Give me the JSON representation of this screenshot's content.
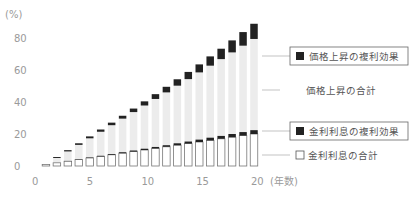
{
  "chart_data": {
    "type": "bar",
    "title": "",
    "xlabel": "(年数)",
    "ylabel": "(%)",
    "ylim": [
      0,
      80
    ],
    "xlim": [
      0,
      20
    ],
    "yticks": [
      "0",
      "20",
      "40",
      "60",
      "80"
    ],
    "xticks": [
      "0",
      "5",
      "10",
      "15",
      "20"
    ],
    "grid": false,
    "categories": [
      1,
      2,
      3,
      4,
      5,
      6,
      7,
      8,
      9,
      10,
      11,
      12,
      13,
      14,
      15,
      16,
      17,
      18,
      19,
      20
    ],
    "series": [
      {
        "name": "金利利息の合計",
        "values": [
          1,
          2,
          3,
          4,
          5,
          6,
          7,
          8,
          9,
          10,
          11,
          12,
          13,
          14,
          15,
          16,
          17,
          18,
          19,
          20
        ]
      },
      {
        "name": "金利利息の複利効果",
        "values": [
          0,
          0,
          0.1,
          0.2,
          0.3,
          0.4,
          0.5,
          0.6,
          0.7,
          0.8,
          0.9,
          1.0,
          1.2,
          1.3,
          1.5,
          1.7,
          1.8,
          2.0,
          2.2,
          2.4
        ]
      },
      {
        "name": "価格上昇の合計",
        "values": [
          0,
          3,
          6,
          9,
          12,
          15,
          18,
          21,
          24,
          27,
          30,
          33,
          36,
          39,
          42,
          45,
          48,
          51,
          54,
          57
        ]
      },
      {
        "name": "価格上昇の複利効果",
        "values": [
          0,
          0.6,
          0.8,
          1.0,
          1.2,
          1.4,
          1.6,
          1.8,
          2.2,
          2.6,
          3.0,
          3.5,
          4.0,
          4.5,
          5.0,
          5.8,
          6.5,
          7.5,
          8.5,
          9.5
        ]
      }
    ],
    "legend": [
      {
        "label": "価格上昇の複利効果",
        "marker": "filled-square"
      },
      {
        "label": "価格上昇の合計",
        "marker": "none"
      },
      {
        "label": "金利利息の複利効果",
        "marker": "filled-square"
      },
      {
        "label": "□ 金利利息の合計",
        "marker": "outline-square"
      }
    ],
    "legend_position": "right",
    "colors": {
      "dark": "#222222",
      "light": "#ececec",
      "outline": "#777777",
      "axis_text": "#9a9a9a"
    }
  },
  "labels": {
    "y_unit": "(%)",
    "x_unit": "(年数)",
    "price_compound": "価格上昇の複利効果",
    "price_total": "価格上昇の合計",
    "interest_compound": "金利利息の複利効果",
    "interest_total": "金利利息の合計"
  }
}
